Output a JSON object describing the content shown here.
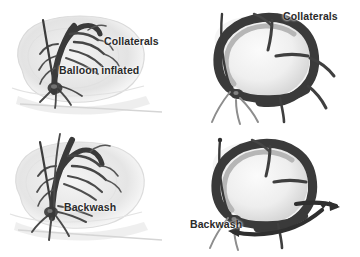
{
  "figure": {
    "background_color": "#ffffff",
    "ink_color": "#2f2f2f",
    "silhouette_color": "#d8d8d8",
    "label_color": "#2a2a2a",
    "panel_count": 4
  },
  "panels": [
    {
      "id": "top-left",
      "name": "angiogram-balloon-inflated",
      "view": "whole-heart-angiogram",
      "labels": [
        "Collaterals",
        "Balloon inflated"
      ]
    },
    {
      "id": "top-right",
      "name": "closeup-balloon-inflated",
      "view": "vessel-loop-closeup",
      "labels": [
        "Collaterals"
      ]
    },
    {
      "id": "bottom-left",
      "name": "angiogram-backwash",
      "view": "whole-heart-angiogram",
      "labels": [
        "Backwash"
      ]
    },
    {
      "id": "bottom-right",
      "name": "closeup-backwash",
      "view": "vessel-loop-closeup",
      "labels": [
        "Backwash"
      ],
      "arrows": [
        "flow-arrow-left",
        "flow-arrow-curved"
      ]
    }
  ],
  "labels": {
    "collaterals_top_left": "Collaterals",
    "balloon_inflated": "Balloon inflated",
    "backwash_bottom_left": "Backwash",
    "collaterals_top_right": "Collaterals",
    "backwash_bottom_right": "Backwash"
  }
}
